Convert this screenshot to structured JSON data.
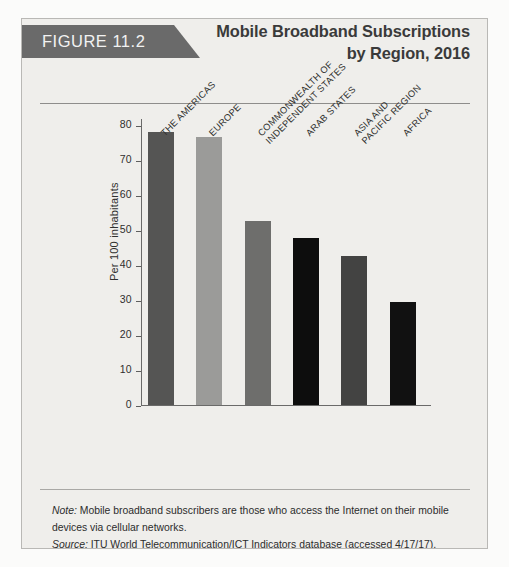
{
  "figure": {
    "tab_label": "FIGURE 11.2",
    "title_line_1": "Mobile Broadband Subscriptions",
    "title_line_2": "by Region, 2016",
    "note_lead": "Note:",
    "note_text": " Mobile broadband subscribers are those who access the Internet on their mobile devices via cellular networks.",
    "source_lead": "Source:",
    "source_text": " ITU World Telecommunication/ICT Indicators database (accessed 4/17/17)."
  },
  "colors": {
    "card_background": "#efeeeb",
    "card_border": "#b9b8b5",
    "tab_background": "#6a6a6a",
    "tab_text": "#f2f2f2",
    "title_text": "#3a3a3a",
    "axis": "#6a6a69"
  },
  "chart_data": {
    "type": "bar",
    "title": "Mobile Broadband Subscriptions by Region, 2016",
    "xlabel": "",
    "ylabel": "Per 100 inhabitants",
    "ylim": [
      0,
      80
    ],
    "ytick_step": 10,
    "yticks": [
      0,
      10,
      20,
      30,
      40,
      50,
      60,
      70,
      80
    ],
    "grid": false,
    "legend": false,
    "categories": [
      "THE AMERICAS",
      "EUROPE",
      "COMMONWEALTH OF\nINDEPENDENT STATES",
      "ARAB STATES",
      "ASIA AND\nPACIFIC REGION",
      "AFRICA"
    ],
    "values": [
      78,
      76.5,
      52.7,
      47.8,
      42.7,
      29.3
    ],
    "bar_colors": [
      "#555554",
      "#9b9b99",
      "#6e6e6c",
      "#0d0d0d",
      "#434342",
      "#111111"
    ]
  }
}
